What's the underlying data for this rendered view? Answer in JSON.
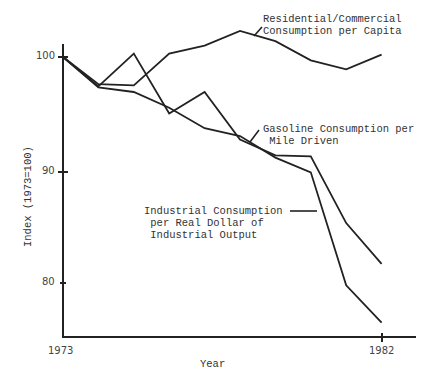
{
  "chart_data": {
    "type": "line",
    "title": "",
    "xlabel": "Year",
    "ylabel": "Index (1973=100)",
    "x": [
      1973,
      1974,
      1975,
      1976,
      1977,
      1978,
      1979,
      1980,
      1981,
      1982
    ],
    "x_tick_labels": [
      "1973",
      "1982"
    ],
    "y_tick_labels": [
      "100",
      "90",
      "80"
    ],
    "y_ticks": [
      100,
      90,
      80
    ],
    "xlim": [
      1973,
      1982.5
    ],
    "ylim": [
      74.5,
      103.2
    ],
    "grid": false,
    "legend_position": "inline annotations",
    "series": [
      {
        "name": "Residential/Commercial Consumption per Capita",
        "values": [
          100.0,
          97.6,
          97.5,
          100.3,
          101.0,
          102.3,
          101.4,
          99.7,
          98.9,
          100.2
        ]
      },
      {
        "name": "Gasoline Consumption per Mile Driven",
        "values": [
          100.0,
          97.4,
          100.3,
          95.0,
          96.9,
          92.7,
          91.3,
          91.2,
          85.3,
          81.7
        ]
      },
      {
        "name": "Industrial Consumption per Real Dollar of Industrial Output",
        "values": [
          100.0,
          97.3,
          96.9,
          95.5,
          93.7,
          93.0,
          91.1,
          89.8,
          79.8,
          76.5
        ]
      }
    ],
    "annotations": [
      {
        "text": "Residential/Commercial\nConsumption per Capita",
        "series": 0
      },
      {
        "text": "Gasoline Consumption per\n Mile Driven",
        "series": 1
      },
      {
        "text": "Industrial Consumption\n per Real Dollar of\n Industrial Output",
        "series": 2
      }
    ]
  },
  "labels": {
    "residential": "Residential/Commercial\nConsumption per Capita",
    "gasoline": "Gasoline Consumption per\n Mile Driven",
    "industrial": "Industrial Consumption\n per Real Dollar of\n Industrial Output",
    "xlabel": "Year",
    "ylabel": "Index (1973=100)",
    "x_first": "1973",
    "x_last": "1982",
    "y100": "100",
    "y90": "90",
    "y80": "80"
  },
  "colors": {
    "line": "#222222",
    "axis": "#222222",
    "text": "#333333"
  }
}
